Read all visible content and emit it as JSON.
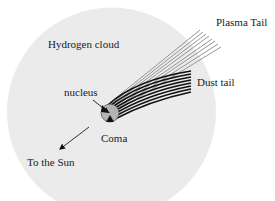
{
  "diagram": {
    "type": "comet-structure",
    "labels": {
      "hydrogen_cloud": "Hydrogen cloud",
      "plasma_tail": "Plasma Tail",
      "dust_tail": "Dust tail",
      "nucleus": "nucleus",
      "coma": "Coma",
      "to_sun": "To the Sun"
    },
    "colors": {
      "hydrogen_cloud_fill": "#ebebeb",
      "coma_fill": "#b3b3b3",
      "plasma_line": "#8a8a8a",
      "dust_line": "#111111",
      "arrow": "#111111",
      "text": "#222222"
    },
    "plasma_tail_line_count": 8,
    "dust_tail_line_count": 8
  }
}
